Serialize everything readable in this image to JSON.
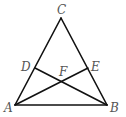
{
  "diagram": {
    "type": "triangle-with-cevians",
    "points": {
      "A": {
        "label": "A",
        "x": 15,
        "y": 105
      },
      "B": {
        "label": "B",
        "x": 107,
        "y": 105
      },
      "C": {
        "label": "C",
        "x": 61,
        "y": 18
      },
      "D": {
        "label": "D",
        "x": 35,
        "y": 68
      },
      "E": {
        "label": "E",
        "x": 88,
        "y": 68
      },
      "F": {
        "label": "F",
        "x": 62,
        "y": 81
      }
    },
    "segments": [
      "AB",
      "BC",
      "CA",
      "BD",
      "AE"
    ],
    "labels": {
      "C": "C",
      "D": "D",
      "E": "E",
      "F": "F",
      "A": "A",
      "B": "B"
    }
  }
}
